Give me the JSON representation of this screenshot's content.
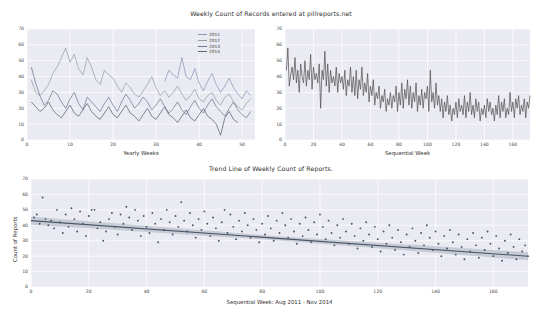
{
  "figure": {
    "background": "#ffffff",
    "axes_background": "#eaeaf2",
    "grid_color": "#ffffff",
    "text_color": "#2f2f2f"
  },
  "top_left": {
    "title": "Weekly Count of Records entered at pillreports.net",
    "xlabel": "Yearly Weeks",
    "legend_title": "",
    "legend": [
      {
        "label": "2011",
        "color": "#8b95b8"
      },
      {
        "label": "2012",
        "color": "#9aa0a6"
      },
      {
        "label": "2013",
        "color": "#6f7b93"
      },
      {
        "label": "2014",
        "color": "#5c6470"
      }
    ]
  },
  "top_right": {
    "xlabel": "Sequential Week"
  },
  "bottom": {
    "title": "Trend Line of Weekly Count of Reports.",
    "xlabel": "Sequential Week: Aug 2011 - Nov 2014",
    "ylabel": "Count of Reports"
  },
  "chart_data": [
    {
      "id": "weekly-by-year",
      "type": "line",
      "title": "Weekly Count of Records entered at pillreports.net",
      "xlabel": "Yearly Weeks",
      "ylabel": "",
      "xlim": [
        0,
        53
      ],
      "ylim": [
        0,
        70
      ],
      "xticks": [
        0,
        10,
        20,
        30,
        40,
        50
      ],
      "yticks": [
        0,
        10,
        20,
        30,
        40,
        50,
        60,
        70
      ],
      "grid": true,
      "legend_position": "upper right",
      "x": [
        1,
        2,
        3,
        4,
        5,
        6,
        7,
        8,
        9,
        10,
        11,
        12,
        13,
        14,
        15,
        16,
        17,
        18,
        19,
        20,
        21,
        22,
        23,
        24,
        25,
        26,
        27,
        28,
        29,
        30,
        31,
        32,
        33,
        34,
        35,
        36,
        37,
        38,
        39,
        40,
        41,
        42,
        43,
        44,
        45,
        46,
        47,
        48,
        49,
        50,
        51,
        52
      ],
      "series": [
        {
          "name": "2011",
          "color": "#8b95b8",
          "values": [
            null,
            null,
            null,
            null,
            null,
            null,
            null,
            null,
            null,
            null,
            null,
            null,
            null,
            null,
            null,
            null,
            null,
            null,
            null,
            null,
            null,
            null,
            null,
            null,
            null,
            null,
            null,
            null,
            null,
            null,
            null,
            37,
            44,
            41,
            39,
            52,
            40,
            38,
            45,
            36,
            31,
            37,
            42,
            35,
            30,
            34,
            39,
            33,
            29,
            26,
            31,
            28
          ]
        },
        {
          "name": "2012",
          "color": "#9aa0a6",
          "values": [
            38,
            30,
            28,
            31,
            35,
            42,
            46,
            52,
            58,
            49,
            54,
            45,
            41,
            52,
            46,
            38,
            35,
            44,
            41,
            39,
            34,
            30,
            36,
            33,
            29,
            27,
            31,
            35,
            40,
            33,
            28,
            31,
            27,
            30,
            34,
            29,
            25,
            28,
            32,
            26,
            24,
            28,
            30,
            25,
            22,
            27,
            29,
            24,
            21,
            19,
            23,
            26
          ]
        },
        {
          "name": "2013",
          "color": "#6f7b93",
          "values": [
            46,
            36,
            28,
            22,
            25,
            31,
            29,
            24,
            20,
            26,
            30,
            23,
            19,
            27,
            24,
            21,
            18,
            23,
            27,
            22,
            18,
            24,
            29,
            25,
            20,
            23,
            27,
            24,
            19,
            22,
            26,
            21,
            17,
            20,
            24,
            19,
            16,
            21,
            25,
            20,
            17,
            22,
            26,
            21,
            18,
            15,
            20,
            24,
            19,
            16,
            14,
            18
          ]
        },
        {
          "name": "2014",
          "color": "#5c6470",
          "values": [
            24,
            21,
            18,
            20,
            24,
            19,
            16,
            14,
            18,
            22,
            17,
            15,
            19,
            23,
            18,
            15,
            13,
            17,
            21,
            16,
            14,
            18,
            22,
            17,
            15,
            12,
            16,
            20,
            15,
            13,
            17,
            21,
            16,
            14,
            11,
            15,
            19,
            14,
            12,
            16,
            20,
            15,
            13,
            10,
            3,
            14,
            18,
            13,
            11,
            null,
            null,
            null
          ]
        }
      ]
    },
    {
      "id": "sequential-weeks",
      "type": "line",
      "title": "",
      "xlabel": "Sequential Week",
      "ylabel": "",
      "xlim": [
        0,
        172
      ],
      "ylim": [
        0,
        70
      ],
      "xticks": [
        0,
        20,
        40,
        60,
        80,
        100,
        120,
        140,
        160
      ],
      "yticks": [
        0,
        10,
        20,
        30,
        40,
        50,
        60,
        70
      ],
      "grid": true,
      "line_color": "#4d4d4d",
      "values": [
        44,
        58,
        34,
        41,
        46,
        38,
        52,
        36,
        44,
        30,
        48,
        40,
        36,
        50,
        34,
        44,
        38,
        54,
        32,
        46,
        38,
        42,
        36,
        48,
        20,
        44,
        38,
        56,
        34,
        48,
        30,
        44,
        36,
        40,
        34,
        46,
        30,
        42,
        36,
        40,
        32,
        44,
        28,
        38,
        34,
        46,
        30,
        40,
        28,
        44,
        26,
        38,
        32,
        46,
        28,
        36,
        30,
        42,
        24,
        34,
        28,
        38,
        22,
        30,
        26,
        34,
        20,
        28,
        24,
        32,
        18,
        26,
        22,
        30,
        20,
        28,
        24,
        34,
        18,
        30,
        22,
        36,
        20,
        32,
        26,
        38,
        22,
        34,
        20,
        30,
        24,
        36,
        18,
        28,
        22,
        32,
        20,
        30,
        26,
        34,
        18,
        44,
        24,
        30,
        20,
        36,
        22,
        28,
        18,
        26,
        14,
        24,
        18,
        28,
        16,
        22,
        12,
        20,
        16,
        24,
        14,
        26,
        18,
        22,
        16,
        28,
        14,
        24,
        18,
        30,
        16,
        22,
        14,
        26,
        18,
        24,
        12,
        20,
        16,
        22,
        14,
        26,
        18,
        24,
        16,
        20,
        12,
        22,
        16,
        28,
        14,
        24,
        18,
        26,
        14,
        20,
        16,
        30,
        18,
        24,
        14,
        26,
        20,
        28,
        16,
        22,
        18,
        26,
        14,
        24,
        20,
        28
      ]
    },
    {
      "id": "trend-line",
      "type": "scatter",
      "title": "Trend Line of Weekly Count of Reports.",
      "xlabel": "Sequential Week: Aug 2011 - Nov 2014",
      "ylabel": "Count of Reports",
      "xlim": [
        0,
        172
      ],
      "ylim": [
        0,
        70
      ],
      "xticks": [
        0,
        20,
        40,
        60,
        80,
        100,
        120,
        140,
        160
      ],
      "yticks": [
        0,
        10,
        20,
        30,
        40,
        50,
        60,
        70
      ],
      "grid": true,
      "marker_color": "#4a5464",
      "trend_color": "#4a5464",
      "ci_color": "#b9c0cc",
      "trend": {
        "intercept": 43.0,
        "slope": -0.134,
        "ci_half_width_center": 1.3,
        "ci_half_width_edge": 2.6
      },
      "points": [
        [
          1,
          45
        ],
        [
          2,
          47
        ],
        [
          3,
          41
        ],
        [
          4,
          58
        ],
        [
          5,
          44
        ],
        [
          6,
          40
        ],
        [
          7,
          43
        ],
        [
          8,
          38
        ],
        [
          9,
          50
        ],
        [
          10,
          42
        ],
        [
          11,
          35
        ],
        [
          12,
          47
        ],
        [
          13,
          39
        ],
        [
          14,
          51
        ],
        [
          15,
          44
        ],
        [
          16,
          36
        ],
        [
          17,
          49
        ],
        [
          18,
          41
        ],
        [
          19,
          33
        ],
        [
          20,
          46
        ],
        [
          21,
          50
        ],
        [
          22,
          50
        ],
        [
          23,
          38
        ],
        [
          24,
          42
        ],
        [
          25,
          30
        ],
        [
          26,
          36
        ],
        [
          27,
          44
        ],
        [
          28,
          48
        ],
        [
          29,
          39
        ],
        [
          30,
          34
        ],
        [
          31,
          47
        ],
        [
          32,
          41
        ],
        [
          33,
          52
        ],
        [
          34,
          45
        ],
        [
          35,
          37
        ],
        [
          36,
          50
        ],
        [
          37,
          43
        ],
        [
          38,
          33
        ],
        [
          39,
          46
        ],
        [
          40,
          39
        ],
        [
          41,
          35
        ],
        [
          42,
          48
        ],
        [
          43,
          41
        ],
        [
          44,
          29
        ],
        [
          45,
          44
        ],
        [
          46,
          37
        ],
        [
          47,
          50
        ],
        [
          48,
          42
        ],
        [
          49,
          34
        ],
        [
          50,
          46
        ],
        [
          51,
          39
        ],
        [
          52,
          55
        ],
        [
          53,
          43
        ],
        [
          54,
          36
        ],
        [
          55,
          48
        ],
        [
          56,
          40
        ],
        [
          57,
          32
        ],
        [
          58,
          44
        ],
        [
          59,
          37
        ],
        [
          60,
          49
        ],
        [
          61,
          41
        ],
        [
          62,
          33
        ],
        [
          63,
          45
        ],
        [
          64,
          38
        ],
        [
          65,
          30
        ],
        [
          66,
          42
        ],
        [
          67,
          50
        ],
        [
          68,
          35
        ],
        [
          69,
          47
        ],
        [
          70,
          39
        ],
        [
          71,
          31
        ],
        [
          72,
          43
        ],
        [
          73,
          36
        ],
        [
          74,
          48
        ],
        [
          75,
          40
        ],
        [
          76,
          32
        ],
        [
          77,
          44
        ],
        [
          78,
          37
        ],
        [
          79,
          29
        ],
        [
          80,
          41
        ],
        [
          81,
          34
        ],
        [
          82,
          46
        ],
        [
          83,
          38
        ],
        [
          84,
          30
        ],
        [
          85,
          43
        ],
        [
          86,
          35
        ],
        [
          87,
          48
        ],
        [
          88,
          40
        ],
        [
          89,
          32
        ],
        [
          90,
          44
        ],
        [
          91,
          36
        ],
        [
          92,
          28
        ],
        [
          93,
          41
        ],
        [
          94,
          33
        ],
        [
          95,
          45
        ],
        [
          96,
          37
        ],
        [
          97,
          29
        ],
        [
          98,
          42
        ],
        [
          99,
          34
        ],
        [
          100,
          47
        ],
        [
          101,
          39
        ],
        [
          102,
          31
        ],
        [
          103,
          43
        ],
        [
          104,
          35
        ],
        [
          105,
          27
        ],
        [
          106,
          40
        ],
        [
          107,
          32
        ],
        [
          108,
          44
        ],
        [
          109,
          36
        ],
        [
          110,
          28
        ],
        [
          111,
          41
        ],
        [
          112,
          33
        ],
        [
          113,
          25
        ],
        [
          114,
          38
        ],
        [
          115,
          30
        ],
        [
          116,
          42
        ],
        [
          117,
          34
        ],
        [
          118,
          26
        ],
        [
          119,
          39
        ],
        [
          120,
          31
        ],
        [
          121,
          23
        ],
        [
          122,
          36
        ],
        [
          123,
          28
        ],
        [
          124,
          40
        ],
        [
          125,
          32
        ],
        [
          126,
          24
        ],
        [
          127,
          37
        ],
        [
          128,
          29
        ],
        [
          129,
          21
        ],
        [
          130,
          34
        ],
        [
          131,
          26
        ],
        [
          132,
          38
        ],
        [
          133,
          30
        ],
        [
          134,
          22
        ],
        [
          135,
          35
        ],
        [
          136,
          27
        ],
        [
          137,
          40
        ],
        [
          138,
          32
        ],
        [
          139,
          24
        ],
        [
          140,
          36
        ],
        [
          141,
          28
        ],
        [
          142,
          20
        ],
        [
          143,
          33
        ],
        [
          144,
          25
        ],
        [
          145,
          37
        ],
        [
          146,
          29
        ],
        [
          147,
          21
        ],
        [
          148,
          34
        ],
        [
          149,
          26
        ],
        [
          150,
          18
        ],
        [
          151,
          31
        ],
        [
          152,
          23
        ],
        [
          153,
          35
        ],
        [
          154,
          27
        ],
        [
          155,
          19
        ],
        [
          156,
          32
        ],
        [
          157,
          24
        ],
        [
          158,
          36
        ],
        [
          159,
          28
        ],
        [
          160,
          20
        ],
        [
          161,
          33
        ],
        [
          162,
          25
        ],
        [
          163,
          17
        ],
        [
          164,
          30
        ],
        [
          165,
          22
        ],
        [
          166,
          34
        ],
        [
          167,
          26
        ],
        [
          168,
          18
        ],
        [
          169,
          31
        ],
        [
          170,
          23
        ],
        [
          171,
          27
        ],
        [
          172,
          20
        ]
      ]
    }
  ]
}
